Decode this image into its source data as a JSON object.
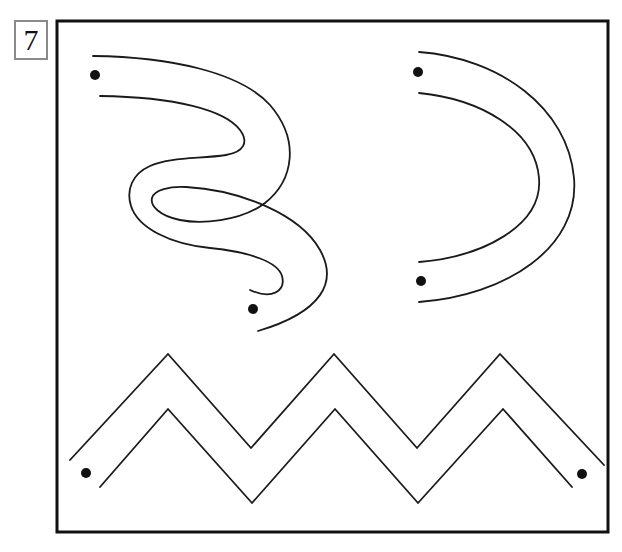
{
  "worksheet": {
    "exercise_number": "7",
    "title_visible": false,
    "background_color": "#ffffff",
    "ink_color": "#1a1a1a",
    "frame": {
      "x": 57,
      "y": 21,
      "width": 551,
      "height": 511,
      "stroke_color": "#111111",
      "stroke_width": 3
    },
    "number_box": {
      "x": 14,
      "y": 20,
      "width": 34,
      "height": 40,
      "border_color": "#8a8a8a"
    }
  },
  "tracing_paths": [
    {
      "id": "s-curve",
      "name": "serpentine-path",
      "shape": "s-curve",
      "stroke_width": 1.8,
      "outer_rail": "M 93 56 C 170 57 240 72 270 105 C 300 140 294 180 265 203 C 240 222 200 224 180 220 C 160 216 150 206 152 198 C 154 190 170 186 186 187 C 240 190 300 214 320 250 C 338 282 322 312 258 331",
      "inner_rail": "M 100 96 C 175 97 225 110 240 130 C 249 142 244 152 226 155 C 200 159 170 157 150 166 C 132 174 126 190 131 206 C 138 228 170 244 210 248 C 250 252 278 262 282 276 C 286 291 272 300 250 290",
      "dots": [
        {
          "cx": 95,
          "cy": 75,
          "r": 5
        },
        {
          "cx": 253,
          "cy": 309,
          "r": 5
        }
      ]
    },
    {
      "id": "c-arc",
      "name": "c-shaped-arc-path",
      "shape": "c-arc",
      "stroke_width": 1.8,
      "outer_rail": "M 419 52 C 500 58 568 108 574 178 C 580 248 505 296 419 302",
      "inner_rail": "M 419 93 C 480 99 535 130 539 178 C 543 226 482 257 419 262",
      "dots": [
        {
          "cx": 418,
          "cy": 72,
          "r": 5
        },
        {
          "cx": 421,
          "cy": 281,
          "r": 5
        }
      ]
    },
    {
      "id": "zigzag",
      "name": "zigzag-path",
      "shape": "zigzag",
      "stroke_width": 1.8,
      "outer_rail": "M 70 460 L 168 354 L 251 448 L 334 354 L 417 448 L 500 354 L 604 465",
      "inner_rail": "M 100 487 L 168 409 L 252 503 L 335 409 L 418 503 L 503 409 L 572 487",
      "dots": [
        {
          "cx": 86,
          "cy": 473,
          "r": 5
        },
        {
          "cx": 582,
          "cy": 474,
          "r": 5
        }
      ]
    }
  ]
}
